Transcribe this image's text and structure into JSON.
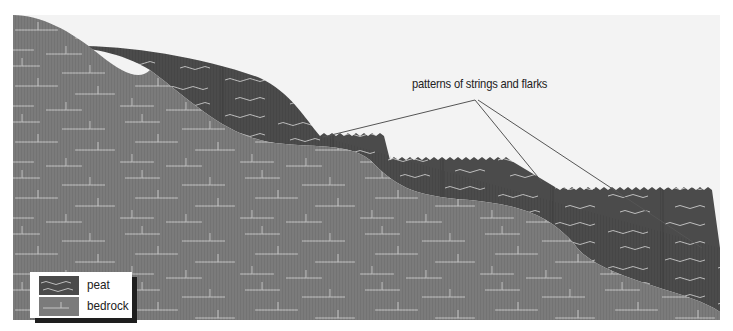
{
  "diagram": {
    "annotation": {
      "label": "patterns of strings and flarks",
      "anchor": [
        475,
        100
      ],
      "targets": [
        [
          323,
          137
        ],
        [
          542,
          182
        ],
        [
          702,
          248
        ]
      ]
    },
    "legend": {
      "items": [
        {
          "key": "peat",
          "label": "peat",
          "color": "#4b4b4b"
        },
        {
          "key": "bedrock",
          "label": "bedrock",
          "color": "#7b7b7b"
        }
      ]
    },
    "colors": {
      "sky": "#f3f3f3",
      "peat": "#4b4b4b",
      "bedrock": "#7b7b7b",
      "texture_line": "#c8c8c8",
      "leader_line": "#555555"
    }
  }
}
